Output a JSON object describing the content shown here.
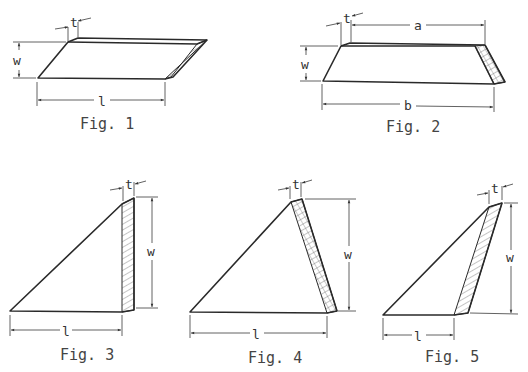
{
  "figures": [
    {
      "id": "fig1",
      "caption": "Fig. 1",
      "shape": "parallelogram prism",
      "labels": {
        "t": "t",
        "w": "w",
        "l": "l"
      }
    },
    {
      "id": "fig2",
      "caption": "Fig. 2",
      "shape": "trapezoid prism",
      "labels": {
        "t": "t",
        "w": "w",
        "a": "a",
        "b": "b"
      }
    },
    {
      "id": "fig3",
      "caption": "Fig. 3",
      "shape": "right triangle prism",
      "labels": {
        "t": "t",
        "w": "w",
        "l": "l"
      }
    },
    {
      "id": "fig4",
      "caption": "Fig. 4",
      "shape": "triangle prism",
      "labels": {
        "t": "t",
        "w": "w",
        "l": "l"
      }
    },
    {
      "id": "fig5",
      "caption": "Fig. 5",
      "shape": "obtuse triangle prism",
      "labels": {
        "t": "t",
        "w": "w",
        "l": "l"
      }
    }
  ],
  "colors": {
    "line": "#2a2a2a",
    "background": "#ffffff"
  }
}
